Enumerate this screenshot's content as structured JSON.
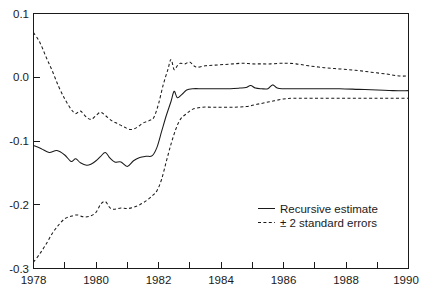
{
  "chart_data": {
    "type": "line",
    "title": "",
    "xlabel": "",
    "ylabel": "",
    "xlim": [
      1978,
      1990
    ],
    "ylim": [
      -0.3,
      0.1
    ],
    "grid": false,
    "legend_position": "center-right",
    "x_ticks": [
      1978,
      1980,
      1982,
      1984,
      1986,
      1988,
      1990
    ],
    "x_tick_labels": [
      "1978",
      "1980",
      "1982",
      "1984",
      "1986",
      "1988",
      "1990"
    ],
    "x_minor_ticks": [
      1979,
      1981,
      1983,
      1985,
      1987,
      1989
    ],
    "y_ticks": [
      0.1,
      0.0,
      -0.1,
      -0.2,
      -0.3
    ],
    "y_tick_labels": [
      "0.1",
      "0.0",
      "-0.1",
      "-0.2",
      "-0.3"
    ],
    "series": [
      {
        "name": "Recursive estimate",
        "style": "solid",
        "color": "#1a1a1a",
        "x": [
          1978.0,
          1978.25,
          1978.5,
          1978.75,
          1979.0,
          1979.2,
          1979.35,
          1979.5,
          1979.7,
          1979.85,
          1980.0,
          1980.15,
          1980.3,
          1980.45,
          1980.6,
          1980.8,
          1981.0,
          1981.2,
          1981.4,
          1981.6,
          1981.8,
          1981.95,
          1982.1,
          1982.25,
          1982.4,
          1982.5,
          1982.6,
          1982.75,
          1982.9,
          1983.1,
          1983.4,
          1983.7,
          1984.0,
          1984.3,
          1984.6,
          1984.8,
          1984.95,
          1985.1,
          1985.3,
          1985.5,
          1985.65,
          1985.8,
          1986.0,
          1986.3,
          1986.7,
          1987.2,
          1987.8,
          1988.4,
          1989.0,
          1989.5,
          1990.0
        ],
        "y": [
          -0.107,
          -0.112,
          -0.118,
          -0.115,
          -0.122,
          -0.132,
          -0.128,
          -0.134,
          -0.138,
          -0.136,
          -0.131,
          -0.124,
          -0.118,
          -0.127,
          -0.133,
          -0.133,
          -0.14,
          -0.131,
          -0.126,
          -0.124,
          -0.123,
          -0.11,
          -0.085,
          -0.06,
          -0.038,
          -0.022,
          -0.032,
          -0.027,
          -0.02,
          -0.018,
          -0.018,
          -0.018,
          -0.018,
          -0.018,
          -0.017,
          -0.016,
          -0.013,
          -0.017,
          -0.018,
          -0.018,
          -0.012,
          -0.017,
          -0.018,
          -0.018,
          -0.018,
          -0.018,
          -0.018,
          -0.019,
          -0.02,
          -0.021,
          -0.021
        ]
      },
      {
        "name": "+ 2 standard errors",
        "style": "dashed",
        "color": "#1a1a1a",
        "x": [
          1978.0,
          1978.2,
          1978.4,
          1978.6,
          1978.8,
          1979.0,
          1979.2,
          1979.35,
          1979.5,
          1979.7,
          1979.85,
          1980.0,
          1980.15,
          1980.3,
          1980.5,
          1980.7,
          1980.9,
          1981.1,
          1981.3,
          1981.5,
          1981.7,
          1981.85,
          1982.0,
          1982.15,
          1982.3,
          1982.4,
          1982.5,
          1982.6,
          1982.7,
          1982.85,
          1983.0,
          1983.2,
          1983.5,
          1983.8,
          1984.1,
          1984.4,
          1984.7,
          1985.0,
          1985.3,
          1985.6,
          1985.9,
          1986.1,
          1986.4,
          1986.8,
          1987.3,
          1987.8,
          1988.3,
          1988.8,
          1989.3,
          1989.7,
          1990.0
        ],
        "y": [
          0.07,
          0.055,
          0.032,
          0.01,
          -0.014,
          -0.034,
          -0.05,
          -0.057,
          -0.053,
          -0.063,
          -0.066,
          -0.06,
          -0.055,
          -0.06,
          -0.068,
          -0.073,
          -0.078,
          -0.082,
          -0.079,
          -0.072,
          -0.068,
          -0.063,
          -0.042,
          -0.012,
          0.012,
          0.028,
          0.012,
          0.018,
          0.022,
          0.021,
          0.024,
          0.016,
          0.018,
          0.019,
          0.02,
          0.021,
          0.022,
          0.021,
          0.021,
          0.021,
          0.022,
          0.022,
          0.021,
          0.018,
          0.015,
          0.013,
          0.011,
          0.008,
          0.005,
          0.002,
          0.002
        ]
      },
      {
        "name": "- 2 standard errors",
        "style": "dashed",
        "color": "#1a1a1a",
        "x": [
          1978.0,
          1978.2,
          1978.4,
          1978.6,
          1978.8,
          1979.0,
          1979.2,
          1979.4,
          1979.6,
          1979.8,
          1980.0,
          1980.15,
          1980.3,
          1980.45,
          1980.6,
          1980.8,
          1981.0,
          1981.2,
          1981.4,
          1981.6,
          1981.8,
          1981.95,
          1982.1,
          1982.25,
          1982.4,
          1982.55,
          1982.7,
          1982.9,
          1983.1,
          1983.4,
          1983.7,
          1984.0,
          1984.4,
          1984.8,
          1985.1,
          1985.4,
          1985.7,
          1986.0,
          1986.3,
          1986.7,
          1987.2,
          1987.8,
          1988.4,
          1989.0,
          1989.5,
          1990.0
        ],
        "y": [
          -0.29,
          -0.277,
          -0.262,
          -0.245,
          -0.232,
          -0.222,
          -0.218,
          -0.216,
          -0.219,
          -0.218,
          -0.212,
          -0.199,
          -0.195,
          -0.205,
          -0.207,
          -0.205,
          -0.206,
          -0.204,
          -0.2,
          -0.194,
          -0.186,
          -0.178,
          -0.16,
          -0.132,
          -0.105,
          -0.082,
          -0.066,
          -0.057,
          -0.05,
          -0.047,
          -0.047,
          -0.047,
          -0.047,
          -0.046,
          -0.043,
          -0.04,
          -0.037,
          -0.034,
          -0.033,
          -0.033,
          -0.033,
          -0.033,
          -0.033,
          -0.033,
          -0.033,
          -0.033
        ]
      }
    ],
    "legend": [
      {
        "label": "Recursive estimate",
        "style": "solid"
      },
      {
        "label": "± 2 standard errors",
        "style": "dashed"
      }
    ]
  },
  "axes": {
    "y_labels": [
      "0.1",
      "0.0",
      "-0.1",
      "-0.2",
      "-0.3"
    ],
    "x_labels": [
      "1978",
      "1980",
      "1982",
      "1984",
      "1986",
      "1988",
      "1990"
    ]
  },
  "legend": {
    "entries": [
      {
        "label": "Recursive estimate"
      },
      {
        "label": "± 2 standard errors"
      }
    ]
  },
  "colors": {
    "line": "#1a1a1a",
    "background": "#ffffff",
    "axis": "#1a1a1a"
  }
}
